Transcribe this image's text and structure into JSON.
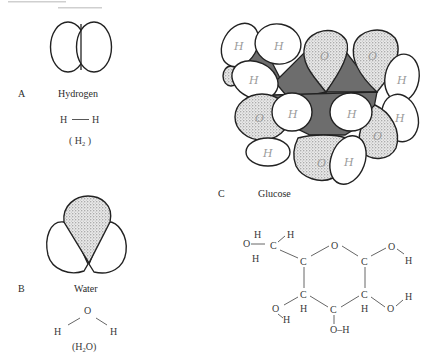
{
  "header": {
    "cut_off_text": "..."
  },
  "panels": [
    {
      "letter": "A",
      "name": "Hydrogen",
      "structural_formula": {
        "left": "H",
        "bond": "—",
        "right": "H"
      },
      "molecular_formula": {
        "open": "( H",
        "sub": "2",
        "close": " )"
      }
    },
    {
      "letter": "B",
      "name": "Water",
      "structural_formula": {
        "center": "O",
        "left": "H",
        "right": "H"
      },
      "molecular_formula": {
        "open": "(H",
        "sub": "2",
        "close": "O)"
      }
    },
    {
      "letter": "C",
      "name": "Glucose",
      "model_atom_labels": {
        "hydrogen": "H",
        "oxygen": "O",
        "carbon": "C"
      },
      "structural_formula": {
        "ring_oxygen": "O",
        "carbons": [
          "C",
          "C",
          "C",
          "C",
          "C",
          "C"
        ],
        "ch2oh": {
          "o": "O",
          "h_top": "H",
          "h_left": "H",
          "h_c": "H",
          "c": "C"
        },
        "c1_oh": {
          "o": "O",
          "h": "H"
        },
        "c2_oh": {
          "o": "O",
          "h": "H",
          "ch": "H"
        },
        "c3_oh": {
          "text": "O–H"
        },
        "c4_oh": {
          "o": "O",
          "h": "H",
          "ch": "H"
        }
      }
    }
  ],
  "colors": {
    "line": "#222222",
    "carbon_fill": "#6d6d6d",
    "text": "#2b2b2b",
    "background": "#ffffff"
  }
}
